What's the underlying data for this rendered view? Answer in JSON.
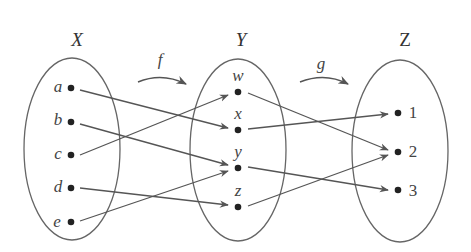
{
  "sets": {
    "X": {
      "title": "X",
      "elements": [
        "a",
        "b",
        "c",
        "d",
        "e"
      ]
    },
    "Y": {
      "title": "Y",
      "elements": [
        "w",
        "x",
        "y",
        "z"
      ]
    },
    "Z": {
      "title": "Z",
      "elements": [
        "1",
        "2",
        "3"
      ]
    }
  },
  "functions": {
    "f": {
      "label": "f",
      "from": "X",
      "to": "Y",
      "mapping": [
        [
          "a",
          "x"
        ],
        [
          "b",
          "y"
        ],
        [
          "c",
          "w"
        ],
        [
          "d",
          "z"
        ],
        [
          "e",
          "y"
        ]
      ]
    },
    "g": {
      "label": "g",
      "from": "Y",
      "to": "Z",
      "mapping": [
        [
          "w",
          "2"
        ],
        [
          "x",
          "1"
        ],
        [
          "y",
          "3"
        ],
        [
          "z",
          "2"
        ]
      ]
    }
  },
  "colors": {
    "line": "#555555",
    "dot": "#222222",
    "ellipse": "#666666"
  }
}
